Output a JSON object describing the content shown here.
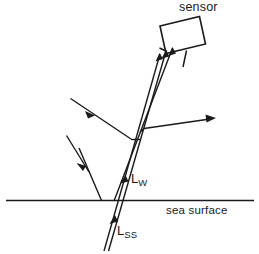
{
  "figure": {
    "labels": {
      "sensor": "sensor",
      "sea_surface": "sea surface",
      "lw_base": "L",
      "lw_sub": "W",
      "lss_base": "L",
      "lss_sub": "SS"
    },
    "colors": {
      "ink": "#1a1a1a",
      "background": "#ffffff"
    }
  },
  "diagram_data": {
    "type": "schematic",
    "title": "sensor",
    "description": "Radiative transfer schematic showing water-leaving radiance and sea-surface reflected radiance reaching an airborne sensor above the sea surface.",
    "elements": [
      {
        "name": "sensor-box",
        "kind": "tilted-rectangle",
        "label": "sensor",
        "corners": [
          [
            160,
            26
          ],
          [
            199,
            17
          ],
          [
            205,
            44
          ],
          [
            166,
            53
          ]
        ]
      },
      {
        "name": "sea-surface-line",
        "kind": "horizontal-line",
        "label": "sea surface",
        "from": [
          6,
          200
        ],
        "to": [
          254,
          200
        ]
      },
      {
        "name": "upwelling-beam-to-sensor",
        "kind": "triple-ray-bundle",
        "label": "L_W and L_SS combined path",
        "from": [
          112,
          200
        ],
        "to": [
          172,
          54
        ],
        "arrowheads": 3
      },
      {
        "name": "water-leaving-radiance-ray",
        "kind": "ray",
        "label": "L_W",
        "from": [
          115,
          200
        ],
        "to": [
          170,
          56
        ]
      },
      {
        "name": "sea-surface-radiance-ray",
        "kind": "double-ray",
        "label": "L_SS",
        "from": [
          103,
          252
        ],
        "to": [
          117,
          196
        ]
      },
      {
        "name": "incident-solar-ray-upper",
        "kind": "arrow-ray",
        "from": [
          71,
          99
        ],
        "to": [
          133,
          140
        ]
      },
      {
        "name": "incident-solar-ray-lower",
        "kind": "arrow-ray",
        "from": [
          67,
          136
        ],
        "to": [
          89,
          172
        ]
      },
      {
        "name": "incident-ray-to-surface",
        "kind": "ray",
        "from": [
          80,
          150
        ],
        "to": [
          101,
          200
        ]
      },
      {
        "name": "reflected-ray-right",
        "kind": "arrow-ray",
        "from": [
          145,
          128
        ],
        "to": [
          215,
          118
        ]
      },
      {
        "name": "sensor-stem",
        "kind": "short-line",
        "from": [
          186,
          51
        ],
        "to": [
          183,
          66
        ]
      }
    ]
  }
}
